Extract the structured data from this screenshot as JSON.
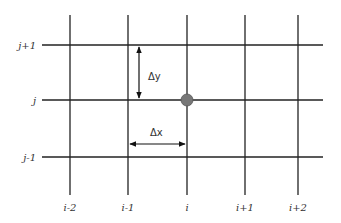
{
  "diagram": {
    "title": "",
    "grid": {
      "columns": [
        {
          "label": "i-2",
          "x": 70
        },
        {
          "label": "i-1",
          "x": 128
        },
        {
          "label": "i",
          "x": 187
        },
        {
          "label": "i+1",
          "x": 245
        },
        {
          "label": "i+2",
          "x": 298
        }
      ],
      "rows": [
        {
          "label": "j+1",
          "y": 45
        },
        {
          "label": "j",
          "y": 100
        },
        {
          "label": "j-1",
          "y": 157
        }
      ],
      "line_color": "#222222"
    },
    "node": {
      "col": "i",
      "row": "j",
      "color": "#777777"
    },
    "annotations": {
      "dy_label": "Δy",
      "dx_label": "Δx"
    }
  }
}
